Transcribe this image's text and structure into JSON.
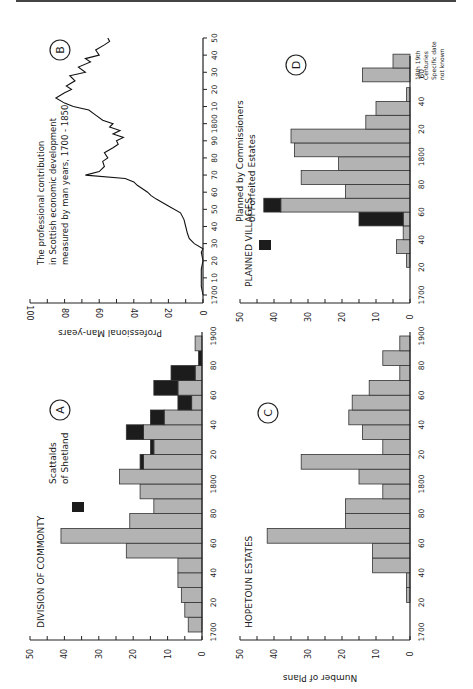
{
  "page": {
    "orientation": "rotated-90-ccw"
  },
  "colors": {
    "bar_fill": "#b3b3b3",
    "bar_stroke": "#333333",
    "highlight_fill": "#1c1c1c",
    "axis": "#222222"
  },
  "chart_data": [
    {
      "id": "A",
      "type": "bar",
      "title": "DIVISION OF COMMONTY",
      "panel_letter": "A",
      "xlabel": "",
      "ylabel": "",
      "ylim": [
        0,
        50
      ],
      "yticks": [
        "0",
        "10",
        "20",
        "30",
        "40",
        "50"
      ],
      "xticks": [
        "1700",
        "20",
        "40",
        "60",
        "80",
        "1800",
        "20",
        "40",
        "60",
        "80",
        "1900"
      ],
      "legend": [
        {
          "name": "Scattalds of Shetland",
          "line1": "Scattalds",
          "line2": "of Shetland",
          "color": "#1c1c1c"
        }
      ],
      "categories": [
        "1700",
        "1710",
        "1720",
        "1730",
        "1740",
        "1750",
        "1760",
        "1770",
        "1780",
        "1790",
        "1800",
        "1810",
        "1820",
        "1830",
        "1840",
        "1850",
        "1860",
        "1870",
        "1880",
        "1890"
      ],
      "series": [
        {
          "name": "Division of Commonty",
          "values": [
            4,
            5,
            6,
            7,
            7,
            22,
            41,
            21,
            14,
            18,
            24,
            17,
            14,
            17,
            11,
            3,
            7,
            2,
            0,
            2
          ]
        },
        {
          "name": "Scattalds of Shetland",
          "values": [
            0,
            0,
            0,
            0,
            0,
            0,
            0,
            0,
            0,
            0,
            0,
            1,
            1,
            5,
            4,
            4,
            7,
            7,
            1,
            0
          ]
        }
      ]
    },
    {
      "id": "B",
      "type": "line",
      "title": "The professional contribution in Scottish economic development measured by man years, 1700 - 1850",
      "title_lines": [
        "The professional contribution",
        "in Scottish economic development",
        "measured by man years, 1700 - 1850"
      ],
      "panel_letter": "B",
      "xlabel": "",
      "ylabel": "Professional Man-years",
      "ylim": [
        0,
        100
      ],
      "yticks": [
        "0",
        "20",
        "40",
        "60",
        "80",
        "100"
      ],
      "xticks": [
        "1700",
        "10",
        "20",
        "30",
        "40",
        "50",
        "60",
        "70",
        "80",
        "90",
        "1800",
        "10",
        "20",
        "30",
        "40",
        "50"
      ],
      "x": [
        1700,
        1705,
        1710,
        1715,
        1720,
        1725,
        1727,
        1730,
        1733,
        1736,
        1740,
        1744,
        1748,
        1752,
        1756,
        1758,
        1760,
        1764,
        1766,
        1768,
        1770,
        1772,
        1775,
        1778,
        1780,
        1783,
        1786,
        1788,
        1790,
        1792,
        1794,
        1796,
        1798,
        1800,
        1802,
        1805,
        1808,
        1810,
        1812,
        1815,
        1818,
        1820,
        1822,
        1825,
        1828,
        1830,
        1833,
        1836,
        1838,
        1840,
        1843,
        1846,
        1848,
        1850
      ],
      "values": [
        0,
        1,
        1,
        1,
        0,
        1,
        0,
        5,
        8,
        9,
        10,
        11,
        13,
        20,
        27,
        30,
        32,
        38,
        40,
        45,
        68,
        60,
        57,
        58,
        55,
        57,
        52,
        49,
        50,
        46,
        52,
        48,
        54,
        52,
        58,
        62,
        66,
        75,
        80,
        85,
        80,
        76,
        79,
        74,
        77,
        68,
        72,
        65,
        68,
        60,
        62,
        57,
        54,
        55
      ]
    },
    {
      "id": "C",
      "type": "bar",
      "title": "HOPETOUN ESTATES",
      "panel_letter": "C",
      "xlabel": "",
      "ylabel": "Number of Plans",
      "ylim": [
        0,
        50
      ],
      "yticks": [
        "0",
        "10",
        "20",
        "30",
        "40",
        "50"
      ],
      "xticks": [
        "1700",
        "20",
        "40",
        "60",
        "80",
        "1800",
        "20",
        "40",
        "60",
        "80",
        "1900"
      ],
      "categories": [
        "1700",
        "1710",
        "1720",
        "1730",
        "1740",
        "1750",
        "1760",
        "1770",
        "1780",
        "1790",
        "1800",
        "1810",
        "1820",
        "1830",
        "1840",
        "1850",
        "1860",
        "1870",
        "1880",
        "1890"
      ],
      "values": [
        0,
        0,
        1,
        1,
        11,
        11,
        42,
        19,
        19,
        8,
        15,
        32,
        8,
        14,
        18,
        17,
        12,
        3,
        8,
        3
      ]
    },
    {
      "id": "D",
      "type": "bar",
      "title": "PLANNED VILLAGES",
      "panel_letter": "D",
      "xlabel": "",
      "ylabel": "",
      "ylim": [
        0,
        50
      ],
      "yticks": [
        "0",
        "10",
        "20",
        "30",
        "40",
        "50"
      ],
      "xticks": [
        "1700",
        "20",
        "40",
        "60",
        "80",
        "1800",
        "20",
        "40",
        "60"
      ],
      "extra_categories_label": [
        "18th 19th",
        "Centuries",
        "Specific date",
        "not known"
      ],
      "legend": [
        {
          "name": "Planned by Commissioners of Forfeited Estates",
          "line1": "Planned by Commissioners",
          "line2": "of Forfeited Estates",
          "color": "#1c1c1c"
        }
      ],
      "categories": [
        "1700",
        "1710",
        "1720",
        "1730",
        "1740",
        "1750",
        "1760",
        "1770",
        "1780",
        "1790",
        "1800",
        "1810",
        "1820",
        "1830",
        "1840",
        "1850",
        "1860",
        "18th C",
        "19th C"
      ],
      "series": [
        {
          "name": "Planned villages",
          "values": [
            0,
            0,
            1,
            4,
            2,
            2,
            38,
            19,
            32,
            21,
            34,
            35,
            13,
            10,
            1,
            0,
            0,
            14,
            5
          ]
        },
        {
          "name": "Planned by Commissioners of Forfeited Estates",
          "values": [
            0,
            0,
            0,
            0,
            0,
            13,
            5,
            0,
            0,
            0,
            0,
            0,
            0,
            0,
            0,
            0,
            0,
            0,
            0
          ]
        }
      ]
    }
  ]
}
